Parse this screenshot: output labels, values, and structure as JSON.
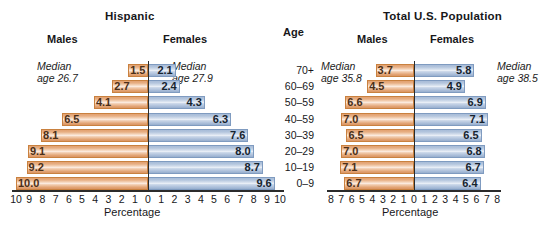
{
  "figure": {
    "age_column_header": "Age",
    "age_groups": [
      "70+",
      "60–69",
      "50–59",
      "40–59",
      "30–39",
      "20–29",
      "10–19",
      "0–9"
    ],
    "male_color": "#e2a171",
    "female_color": "#a8bcd8"
  },
  "chart_data": [
    {
      "type": "bar",
      "title": "Hispanic",
      "subtype": "population-pyramid",
      "xlabel": "Percentage",
      "ylabel": "Age",
      "categories": [
        "70+",
        "60–69",
        "50–59",
        "40–59",
        "30–39",
        "20–29",
        "10–19",
        "0–9"
      ],
      "series": [
        {
          "name": "Males",
          "side": "left",
          "values": [
            1.5,
            2.7,
            4.1,
            6.5,
            8.1,
            9.1,
            9.2,
            10.0
          ]
        },
        {
          "name": "Females",
          "side": "right",
          "values": [
            2.1,
            2.4,
            4.3,
            6.3,
            7.6,
            8.0,
            8.7,
            9.6
          ]
        }
      ],
      "xlim": [
        0,
        10
      ],
      "xticks": [
        10,
        9,
        8,
        7,
        6,
        5,
        4,
        3,
        2,
        1,
        0,
        1,
        2,
        3,
        4,
        5,
        6,
        7,
        8,
        9,
        10
      ],
      "grid": false,
      "annotations": [
        {
          "text_line1": "Median",
          "text_line2": "age 26.7",
          "side": "left"
        },
        {
          "text_line1": "Median",
          "text_line2": "age 27.9",
          "side": "right"
        }
      ],
      "headers": {
        "left": "Males",
        "right": "Females"
      }
    },
    {
      "type": "bar",
      "title": "Total U.S. Population",
      "subtype": "population-pyramid",
      "xlabel": "Percentage",
      "ylabel": "Age",
      "categories": [
        "70+",
        "60–69",
        "50–59",
        "40–59",
        "30–39",
        "20–29",
        "10–19",
        "0–9"
      ],
      "series": [
        {
          "name": "Males",
          "side": "left",
          "values": [
            3.7,
            4.5,
            6.6,
            7.0,
            6.5,
            7.0,
            7.1,
            6.7
          ]
        },
        {
          "name": "Females",
          "side": "right",
          "values": [
            5.8,
            4.9,
            6.9,
            7.1,
            6.5,
            6.8,
            6.7,
            6.4
          ]
        }
      ],
      "xlim": [
        0,
        8
      ],
      "xticks": [
        8,
        7,
        6,
        5,
        4,
        3,
        2,
        1,
        0,
        1,
        2,
        3,
        4,
        5,
        6,
        7,
        8
      ],
      "grid": false,
      "annotations": [
        {
          "text_line1": "Median",
          "text_line2": "age 35.8",
          "side": "left"
        },
        {
          "text_line1": "Median",
          "text_line2": "age 38.5",
          "side": "right"
        }
      ],
      "headers": {
        "left": "Males",
        "right": "Females"
      }
    }
  ]
}
